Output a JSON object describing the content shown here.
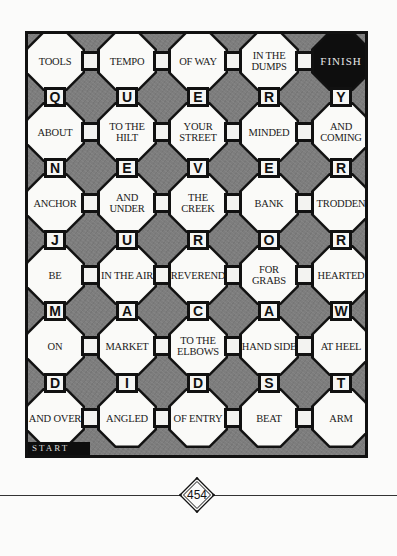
{
  "puzzle": {
    "start_label": "START",
    "finish_label": "FINISH",
    "word_rows": [
      [
        "TOOLS",
        "TEMPO",
        "OF WAY",
        "IN THE DUMPS",
        "FINISH"
      ],
      [
        "ABOUT",
        "TO THE HILT",
        "YOUR STREET",
        "MINDED",
        "AND COMING"
      ],
      [
        "ANCHOR",
        "AND UNDER",
        "THE CREEK",
        "BANK",
        "TRODDEN"
      ],
      [
        "BE",
        "IN THE AIR",
        "REVEREND",
        "FOR GRABS",
        "HEARTED"
      ],
      [
        "ON",
        "MARKET",
        "TO THE ELBOWS",
        "HAND SIDE",
        "AT HEEL"
      ],
      [
        "AND OVER",
        "ANGLED",
        "OF ENTRY",
        "BEAT",
        "ARM"
      ]
    ],
    "letter_rows": [
      [
        "Q",
        "U",
        "E",
        "R",
        "Y"
      ],
      [
        "N",
        "E",
        "V",
        "E",
        "R"
      ],
      [
        "J",
        "U",
        "R",
        "O",
        "R"
      ],
      [
        "M",
        "A",
        "C",
        "A",
        "W"
      ],
      [
        "D",
        "I",
        "D",
        "S",
        "T"
      ]
    ]
  },
  "page": {
    "number": "454"
  },
  "colors": {
    "board_shade": "#7d7d7d",
    "cell": "#fafaf8",
    "ink": "#111111"
  }
}
